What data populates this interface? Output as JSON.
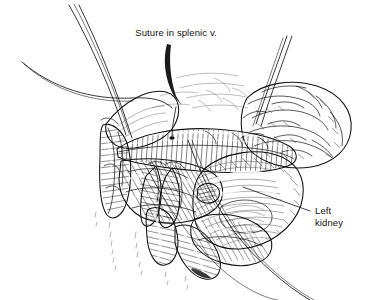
{
  "figure": {
    "type": "medical-line-illustration",
    "background_color": "#ffffff",
    "ink_color": "#111111",
    "width": 370,
    "height": 300
  },
  "labels": [
    {
      "id": "suture-splenic-vein",
      "text": "Suture in splenic v.",
      "x": 176,
      "y": 36,
      "anchor": "middle",
      "leader": "curved-tapered-arrow",
      "leader_from": [
        168,
        44
      ],
      "leader_to": [
        181,
        106
      ]
    },
    {
      "id": "left-kidney",
      "line1": "Left",
      "line2": "kidney",
      "x": 315,
      "y": 214,
      "anchor": "start",
      "leader": "straight-line",
      "leader_from": [
        310,
        211
      ],
      "leader_to": [
        243,
        187
      ]
    }
  ],
  "structures": [
    {
      "id": "splenic-vein",
      "name": "splenic vein",
      "rendering": "cross-hatched tubular vessel"
    },
    {
      "id": "left-kidney",
      "name": "left kidney",
      "rendering": "smooth contoured ovoid mass"
    },
    {
      "id": "pancreas-tail",
      "name": "pancreatic tail",
      "rendering": "lobulated hatched body"
    },
    {
      "id": "omental-fat",
      "name": "omental fat",
      "rendering": "lobulated outlined mass"
    },
    {
      "id": "tissue-flap",
      "name": "retracted tissue flap",
      "rendering": "dense parallel hatching"
    },
    {
      "id": "finger-projections",
      "name": "finger-like tissue projections",
      "rendering": "hatched tapered lobes"
    }
  ],
  "sutures": [
    {
      "id": "suture-upper-left-a",
      "description": "long thread descending from top-left"
    },
    {
      "id": "suture-upper-left-b",
      "description": "second long thread descending from top-left"
    },
    {
      "id": "suture-horizontal",
      "description": "thread sweeping horizontally from left margin"
    },
    {
      "id": "suture-upper-right-a",
      "description": "thread descending from upper right"
    },
    {
      "id": "suture-upper-right-b",
      "description": "second thread descending from upper right"
    },
    {
      "id": "suture-upper-right-c",
      "description": "third thread descending from upper right"
    },
    {
      "id": "suture-lower-right",
      "description": "paired thread exiting toward lower right"
    }
  ]
}
